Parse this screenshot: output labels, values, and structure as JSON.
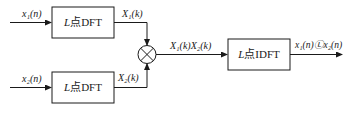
{
  "diagram": {
    "inputs": [
      {
        "label": "x₁(n)"
      },
      {
        "label": "x₂(n)"
      }
    ],
    "blocks": [
      {
        "id": "dft1",
        "var": "L",
        "text": "点DFT"
      },
      {
        "id": "dft2",
        "var": "L",
        "text": "点DFT"
      },
      {
        "id": "idft",
        "var": "L",
        "text": "点IDFT"
      }
    ],
    "signals": {
      "X1": "X₁(k)",
      "X2": "X₂(k)",
      "product": "X₁(k)X₂(k)",
      "output": "x₁(n)Ⓛx₂(n)"
    },
    "multiplier_symbol": "⊗",
    "colors": {
      "line": "#1a1a1a",
      "background": "#ffffff"
    }
  }
}
